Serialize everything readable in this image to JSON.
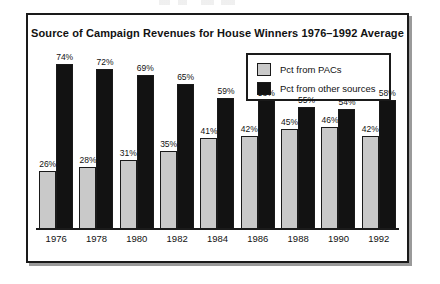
{
  "chart_data": {
    "type": "bar",
    "title": "Source of Campaign Revenues for House Winners 1976–1992 Average",
    "xlabel": "",
    "ylabel": "",
    "ylim": [
      0,
      80
    ],
    "grid": false,
    "legend_position": "top-right",
    "categories": [
      "1976",
      "1978",
      "1980",
      "1982",
      "1984",
      "1986",
      "1988",
      "1990",
      "1992"
    ],
    "series": [
      {
        "name": "Pct from PACs",
        "color": "#c9c9c9",
        "values": [
          26,
          28,
          31,
          35,
          41,
          42,
          45,
          46,
          42
        ],
        "labels": [
          "26%",
          "28%",
          "31%",
          "35%",
          "41%",
          "42%",
          "45%",
          "46%",
          "42%"
        ]
      },
      {
        "name": "Pct from other sources",
        "color": "#121212",
        "values": [
          74,
          72,
          69,
          65,
          59,
          58,
          55,
          54,
          58
        ],
        "labels": [
          "74%",
          "72%",
          "69%",
          "65%",
          "59%",
          "58%",
          "55%",
          "54%",
          "58%"
        ]
      }
    ]
  },
  "legend": {
    "items": [
      {
        "label": "Pct from PACs",
        "swatch": "light-gray"
      },
      {
        "label": "Pct from other sources",
        "swatch": "black"
      }
    ]
  },
  "colors": {
    "pacs_fill": "#c9c9c9",
    "other_fill": "#121212",
    "frame": "#1a1a1a",
    "shadow": "#9a9a9a",
    "background": "#ffffff",
    "text": "#121212"
  }
}
